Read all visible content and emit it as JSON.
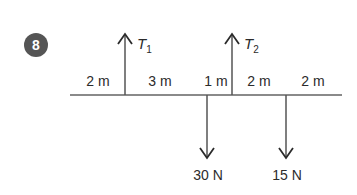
{
  "problem": {
    "number": "8",
    "badge_color": "#555555"
  },
  "beam": {
    "color": "#8a8a8a",
    "segments": [
      {
        "label": "2 m"
      },
      {
        "label": "3 m"
      },
      {
        "label": "1 m"
      },
      {
        "label": "2 m"
      },
      {
        "label": "2 m"
      }
    ]
  },
  "forces": {
    "up": [
      {
        "symbol": "T",
        "subscript": "1"
      },
      {
        "symbol": "T",
        "subscript": "2"
      }
    ],
    "down": [
      {
        "label": "30 N"
      },
      {
        "label": "15 N"
      }
    ]
  }
}
